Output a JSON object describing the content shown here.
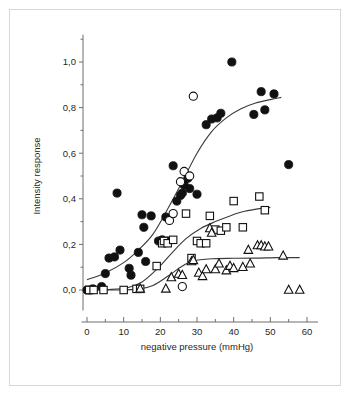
{
  "figure": {
    "background_color": "#ffffff",
    "frame_color": "#d8d8d8",
    "axis_color": "#6e6e6e",
    "marker_color": "#111111"
  },
  "chart_data": {
    "type": "scatter",
    "title": "",
    "xlabel": "negative pressure (mmHg)",
    "ylabel": "Intensity response",
    "xlim": [
      -2,
      65
    ],
    "ylim": [
      -0.07,
      1.09
    ],
    "grid": false,
    "legend": "none",
    "decimal_separator": ",",
    "xticks": [
      0,
      10,
      20,
      30,
      40,
      50,
      60
    ],
    "xticklabels": [
      "0",
      "10",
      "20",
      "30",
      "40",
      "50",
      "60"
    ],
    "xminorticks": [
      5,
      15,
      25,
      35,
      45,
      55
    ],
    "yticks": [
      0.0,
      0.2,
      0.4,
      0.6,
      0.8,
      1.0
    ],
    "yticklabels": [
      "0,0",
      "0,2",
      "0,4",
      "0,6",
      "0,8",
      "1,0"
    ],
    "yminorticks": [
      0.1,
      0.3,
      0.5,
      0.7,
      0.9,
      1.1
    ],
    "series": [
      {
        "name": "filled-circles",
        "marker": "filled-circle",
        "points": [
          [
            0.0,
            0.0
          ],
          [
            0.8,
            0.0
          ],
          [
            1.6,
            0.005
          ],
          [
            4.0,
            0.015
          ],
          [
            5.0,
            0.072
          ],
          [
            6.0,
            0.14
          ],
          [
            7.5,
            0.145
          ],
          [
            8.2,
            0.425
          ],
          [
            9.0,
            0.175
          ],
          [
            11.5,
            0.095
          ],
          [
            12.0,
            0.065
          ],
          [
            14.0,
            0.165
          ],
          [
            15.0,
            0.33
          ],
          [
            15.5,
            0.275
          ],
          [
            16.0,
            0.125
          ],
          [
            17.5,
            0.325
          ],
          [
            19.5,
            0.215
          ],
          [
            20.5,
            0.22
          ],
          [
            21.5,
            0.32
          ],
          [
            22.0,
            0.215
          ],
          [
            23.5,
            0.545
          ],
          [
            24.5,
            0.39
          ],
          [
            25.5,
            0.415
          ],
          [
            26.0,
            0.425
          ],
          [
            26.5,
            0.46
          ],
          [
            27.5,
            0.49
          ],
          [
            28.0,
            0.445
          ],
          [
            30.0,
            0.42
          ],
          [
            32.5,
            0.725
          ],
          [
            34.0,
            0.75
          ],
          [
            35.5,
            0.755
          ],
          [
            36.5,
            0.775
          ],
          [
            39.5,
            1.0
          ],
          [
            45.5,
            0.77
          ],
          [
            47.5,
            0.87
          ],
          [
            48.5,
            0.79
          ],
          [
            51.0,
            0.86
          ],
          [
            55.0,
            0.55
          ]
        ]
      },
      {
        "name": "open-circles",
        "marker": "open-circle",
        "points": [
          [
            22.5,
            0.305
          ],
          [
            23.5,
            0.335
          ],
          [
            25.5,
            0.475
          ],
          [
            26.5,
            0.52
          ],
          [
            28.0,
            0.5
          ],
          [
            29.0,
            0.85
          ],
          [
            26.0,
            0.015
          ]
        ]
      },
      {
        "name": "open-squares",
        "marker": "open-square",
        "points": [
          [
            0.6,
            0.0
          ],
          [
            1.8,
            0.0
          ],
          [
            4.5,
            0.0
          ],
          [
            10.0,
            0.0
          ],
          [
            13.5,
            0.005
          ],
          [
            14.5,
            0.005
          ],
          [
            19.0,
            0.105
          ],
          [
            20.5,
            0.205
          ],
          [
            21.0,
            0.215
          ],
          [
            22.0,
            0.205
          ],
          [
            23.5,
            0.22
          ],
          [
            27.0,
            0.335
          ],
          [
            28.5,
            0.14
          ],
          [
            30.0,
            0.215
          ],
          [
            31.0,
            0.205
          ],
          [
            32.5,
            0.205
          ],
          [
            33.5,
            0.325
          ],
          [
            35.0,
            0.265
          ],
          [
            36.5,
            0.26
          ],
          [
            38.0,
            0.275
          ],
          [
            40.0,
            0.39
          ],
          [
            42.5,
            0.275
          ],
          [
            47.0,
            0.41
          ],
          [
            48.5,
            0.35
          ]
        ]
      },
      {
        "name": "open-triangles",
        "marker": "open-triangle",
        "points": [
          [
            14.5,
            0.005
          ],
          [
            21.5,
            0.005
          ],
          [
            23.0,
            0.055
          ],
          [
            25.0,
            0.07
          ],
          [
            26.0,
            0.065
          ],
          [
            28.5,
            0.125
          ],
          [
            29.0,
            0.13
          ],
          [
            30.5,
            0.075
          ],
          [
            31.5,
            0.06
          ],
          [
            32.5,
            0.09
          ],
          [
            33.5,
            0.27
          ],
          [
            34.0,
            0.25
          ],
          [
            35.0,
            0.09
          ],
          [
            36.0,
            0.115
          ],
          [
            38.0,
            0.085
          ],
          [
            39.0,
            0.105
          ],
          [
            40.0,
            0.095
          ],
          [
            42.5,
            0.1
          ],
          [
            44.0,
            0.175
          ],
          [
            44.5,
            0.115
          ],
          [
            46.5,
            0.195
          ],
          [
            47.5,
            0.195
          ],
          [
            48.5,
            0.19
          ],
          [
            49.5,
            0.19
          ],
          [
            53.5,
            0.15
          ],
          [
            55.0,
            0.0
          ],
          [
            58.0,
            0.0
          ]
        ]
      }
    ],
    "fit_curves": [
      {
        "name": "fit-filled-circles",
        "description": "sigmoid fit through filled circles",
        "points": [
          [
            0,
            0.045
          ],
          [
            5,
            0.075
          ],
          [
            10,
            0.12
          ],
          [
            14,
            0.175
          ],
          [
            18,
            0.245
          ],
          [
            22,
            0.355
          ],
          [
            26,
            0.475
          ],
          [
            30,
            0.6
          ],
          [
            34,
            0.695
          ],
          [
            38,
            0.755
          ],
          [
            42,
            0.795
          ],
          [
            46,
            0.82
          ],
          [
            50,
            0.835
          ],
          [
            53,
            0.845
          ]
        ]
      },
      {
        "name": "fit-open-squares",
        "description": "sigmoid fit through open squares",
        "points": [
          [
            0,
            0.0
          ],
          [
            6,
            0.002
          ],
          [
            11,
            0.01
          ],
          [
            15,
            0.035
          ],
          [
            19,
            0.09
          ],
          [
            23,
            0.16
          ],
          [
            27,
            0.225
          ],
          [
            31,
            0.27
          ],
          [
            35,
            0.3
          ],
          [
            39,
            0.325
          ],
          [
            43,
            0.345
          ],
          [
            47,
            0.357
          ],
          [
            50,
            0.362
          ]
        ]
      },
      {
        "name": "fit-open-triangles",
        "description": "sigmoid fit through open triangles",
        "points": [
          [
            0,
            0.0
          ],
          [
            8,
            0.0
          ],
          [
            14,
            0.004
          ],
          [
            18,
            0.02
          ],
          [
            22,
            0.06
          ],
          [
            26,
            0.105
          ],
          [
            29,
            0.128
          ],
          [
            34,
            0.137
          ],
          [
            40,
            0.139
          ],
          [
            46,
            0.14
          ],
          [
            52,
            0.142
          ],
          [
            58,
            0.142
          ]
        ]
      }
    ]
  }
}
